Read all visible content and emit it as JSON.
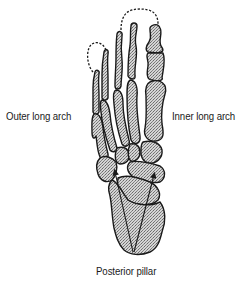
{
  "figure": {
    "labels": {
      "outer_arch": "Outer long arch",
      "inner_arch": "Inner long arch",
      "posterior": "Posterior pillar"
    },
    "colors": {
      "bone_fill": "#bdbdbd",
      "outline": "#1a1a1a",
      "background": "#ffffff"
    },
    "annotations": {
      "dashed_arcs": 2,
      "arrows": 2
    }
  }
}
